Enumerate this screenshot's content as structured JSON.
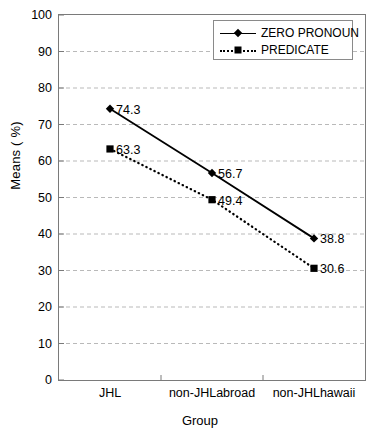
{
  "chart_data": {
    "type": "line",
    "title": "",
    "xlabel": "Group",
    "ylabel": "Means ( %)",
    "categories": [
      "JHL",
      "non-JHLabroad",
      "non-JHLhawaii"
    ],
    "ylim": [
      0,
      100
    ],
    "y_ticks": [
      100,
      90,
      80,
      70,
      60,
      50,
      40,
      30,
      20,
      10,
      0
    ],
    "grid": true,
    "legend_position": "top-right",
    "series": [
      {
        "name": "ZERO PRONOUN",
        "values": [
          74.3,
          56.7,
          38.8
        ],
        "labels": [
          "74.3",
          "56.7",
          "38.8"
        ],
        "marker": "diamond",
        "line_style": "solid",
        "color": "#000000"
      },
      {
        "name": "PREDICATE",
        "values": [
          63.3,
          49.4,
          30.6
        ],
        "labels": [
          "63.3",
          "49.4",
          "30.6"
        ],
        "marker": "square",
        "line_style": "dotted",
        "color": "#000000"
      }
    ]
  },
  "axes": {
    "y_title": "Means ( %)",
    "x_title": "Group",
    "y_tick_labels": [
      "100",
      "90",
      "80",
      "70",
      "60",
      "50",
      "40",
      "30",
      "20",
      "10",
      "0"
    ],
    "x_tick_labels": [
      "JHL",
      "non-JHLabroad",
      "non-JHLhawaii"
    ]
  },
  "legend": {
    "items": [
      {
        "label": "ZERO PRONOUN",
        "marker": "diamond",
        "line_style": "solid"
      },
      {
        "label": "PREDICATE",
        "marker": "square",
        "line_style": "dotted"
      }
    ]
  },
  "colors": {
    "ink": "#000000",
    "axis": "#7a7a7a",
    "grid": "#b9b9b9",
    "background": "#ffffff"
  }
}
